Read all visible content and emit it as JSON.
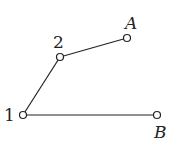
{
  "diagram": {
    "nodes": [
      {
        "id": "1",
        "label": "1",
        "x": 23,
        "y": 115,
        "italic": false
      },
      {
        "id": "2",
        "label": "2",
        "x": 60,
        "y": 57,
        "italic": false
      },
      {
        "id": "A",
        "label": "A",
        "x": 127,
        "y": 38,
        "italic": true
      },
      {
        "id": "B",
        "label": "B",
        "x": 157,
        "y": 115,
        "italic": true
      }
    ],
    "edges": [
      {
        "from": "1",
        "to": "2"
      },
      {
        "from": "2",
        "to": "A"
      },
      {
        "from": "1",
        "to": "B"
      }
    ],
    "labels": {
      "n1": "1",
      "n2": "2",
      "nA": "A",
      "nB": "B"
    },
    "colors": {
      "stroke": "#222222",
      "background": "#ffffff"
    }
  }
}
